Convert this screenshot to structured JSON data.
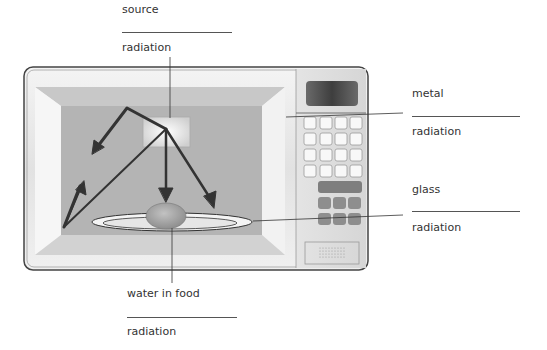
{
  "labels": {
    "top": {
      "line1": "source",
      "line2": "radiation"
    },
    "right_upper": {
      "line1": "metal",
      "line2": "radiation"
    },
    "right_lower": {
      "line1": "glass",
      "line2": "radiation"
    },
    "bottom": {
      "line1": "water in food",
      "line2": "radiation"
    }
  },
  "colors": {
    "cavity": "#b4b4b4",
    "frame": "#e6e6e6",
    "outline": "#444444",
    "arrow": "#333333",
    "display": "#555555",
    "button_dark": "#8a8a8a",
    "food": "#a0a0a0"
  }
}
